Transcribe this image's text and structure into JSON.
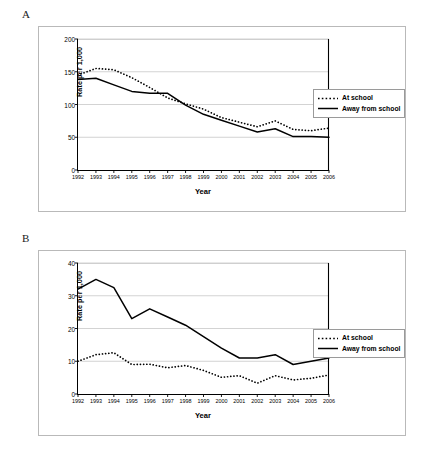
{
  "figure": {
    "panels": [
      {
        "letter": "A",
        "id": "panel-a"
      },
      {
        "letter": "B",
        "id": "panel-b"
      }
    ]
  },
  "chart_data": [
    {
      "type": "line",
      "panel": "A",
      "title": "",
      "xlabel": "Year",
      "ylabel": "Rate per 1,000",
      "categories": [
        "1992",
        "1993",
        "1994",
        "1995",
        "1996",
        "1997",
        "1998",
        "1999",
        "2000",
        "2001",
        "2002",
        "2003",
        "2004",
        "2005",
        "2006"
      ],
      "xticklabels": [
        "1992",
        "1993",
        "1994",
        "1995",
        "1996",
        "1997",
        "1998",
        "1999",
        "2000",
        "2001",
        "2002",
        "2003",
        "2004",
        "2005",
        "2006"
      ],
      "yticks": [
        0,
        50,
        100,
        150,
        200
      ],
      "ylim": [
        0,
        200
      ],
      "grid": "horizontal",
      "legend_position": "right-outside",
      "series": [
        {
          "name": "At school",
          "style": "dotted",
          "values": [
            145,
            155,
            153,
            141,
            126,
            110,
            101,
            93,
            80,
            73,
            66,
            75,
            62,
            60,
            64
          ]
        },
        {
          "name": "Away from school",
          "style": "solid",
          "values": [
            138,
            140,
            130,
            120,
            117,
            117,
            99,
            85,
            76,
            67,
            58,
            63,
            51,
            51,
            50
          ]
        }
      ]
    },
    {
      "type": "line",
      "panel": "B",
      "title": "",
      "xlabel": "Year",
      "ylabel": "Rate per 1,000",
      "categories": [
        "1992",
        "1993",
        "1994",
        "1995",
        "1996",
        "1997",
        "1998",
        "1999",
        "2000",
        "2001",
        "2002",
        "2003",
        "2004",
        "2005",
        "2006"
      ],
      "xticklabels": [
        "1992",
        "1993",
        "1994",
        "1995",
        "1996",
        "1997",
        "1998",
        "1999",
        "2000",
        "2001",
        "2002",
        "2003",
        "2004",
        "2005",
        "2006"
      ],
      "yticks": [
        0,
        10,
        20,
        30,
        40
      ],
      "ylim": [
        0,
        40
      ],
      "grid": "horizontal",
      "legend_position": "right-outside",
      "series": [
        {
          "name": "At school",
          "style": "dotted",
          "values": [
            10,
            12,
            12.6,
            9,
            9.1,
            8,
            8.7,
            7.2,
            5.1,
            5.6,
            3.3,
            5.6,
            4.3,
            4.8,
            5.8
          ]
        },
        {
          "name": "Away from school",
          "style": "solid",
          "values": [
            32,
            35,
            32.5,
            23,
            26,
            23.5,
            21,
            17.5,
            14,
            11,
            11,
            12,
            9,
            10,
            11
          ]
        }
      ]
    }
  ],
  "legend": {
    "at_school": "At school",
    "away_from_school": "Away from school"
  },
  "axis": {
    "ylabel": "Rate per 1,000",
    "xlabel": "Year"
  },
  "colors": {
    "line": "#000000",
    "grid": "#c8c8c8",
    "frame": "#b9b9b9"
  }
}
